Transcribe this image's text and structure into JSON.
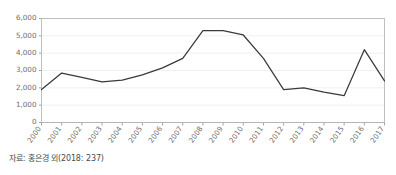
{
  "source_note": "자료: 홍은경 외(2018: 237)",
  "chart_data": {
    "type": "line",
    "title": "",
    "xlabel": "",
    "ylabel": "",
    "grid": true,
    "legend": "none",
    "ylim": [
      0,
      6000
    ],
    "ytick_labels": [
      "6,000",
      "5,000",
      "4,000",
      "3,000",
      "2,000",
      "1,000",
      "0"
    ],
    "ytick_values": [
      6000,
      5000,
      4000,
      3000,
      2000,
      1000,
      0
    ],
    "categories": [
      "2000",
      "2001",
      "2002",
      "2003",
      "2004",
      "2005",
      "2006",
      "2007",
      "2008",
      "2009",
      "2010",
      "2011",
      "2012",
      "2013",
      "2014",
      "2015",
      "2016",
      "2017"
    ],
    "values": [
      1900,
      2850,
      2600,
      2350,
      2450,
      2750,
      3150,
      3700,
      5300,
      5300,
      5050,
      3700,
      1900,
      2000,
      1750,
      1550,
      4200,
      2400
    ],
    "series": [
      {
        "name": "",
        "values": [
          1900,
          2850,
          2600,
          2350,
          2450,
          2750,
          3150,
          3700,
          5300,
          5300,
          5050,
          3700,
          1900,
          2000,
          1750,
          1550,
          4200,
          2400
        ]
      }
    ]
  },
  "colors": {
    "line": "#3a3a3a",
    "grid": "#ececec",
    "border": "#b9b9b9",
    "tick_text": "#6e6e6e",
    "note_text": "#4a4a4a",
    "background": "#ffffff"
  }
}
